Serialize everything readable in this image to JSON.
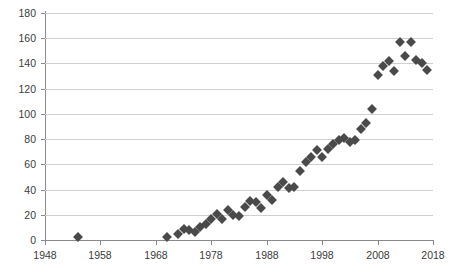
{
  "chart_data": {
    "type": "scatter",
    "title": "",
    "subtitle": "",
    "xlabel": "",
    "ylabel": "",
    "xlim": [
      1948,
      2018
    ],
    "ylim": [
      0,
      180
    ],
    "grid": true,
    "legend": false,
    "legend_position": "none",
    "marker": "diamond",
    "marker_color": "#4a4a4a",
    "grid_color": "#d0d0d0",
    "axis_color": "#8a8a8a",
    "xticks": [
      1948,
      1958,
      1968,
      1978,
      1988,
      1998,
      2008,
      2018
    ],
    "xtick_labels": [
      "1948",
      "1958",
      "1968",
      "1978",
      "1988",
      "1998",
      "2008",
      "2018"
    ],
    "yticks": [
      0,
      20,
      40,
      60,
      80,
      100,
      120,
      140,
      160,
      180
    ],
    "ytick_labels": [
      "0",
      "20",
      "40",
      "60",
      "80",
      "100",
      "120",
      "140",
      "160",
      "180"
    ],
    "series": [
      {
        "name": "observations",
        "points": [
          [
            1954,
            2
          ],
          [
            1970,
            2
          ],
          [
            1972,
            5
          ],
          [
            1973,
            9
          ],
          [
            1974,
            8
          ],
          [
            1975,
            6
          ],
          [
            1976,
            10
          ],
          [
            1977,
            13
          ],
          [
            1978,
            17
          ],
          [
            1979,
            21
          ],
          [
            1980,
            17
          ],
          [
            1981,
            24
          ],
          [
            1982,
            20
          ],
          [
            1983,
            19
          ],
          [
            1984,
            26
          ],
          [
            1985,
            31
          ],
          [
            1986,
            30
          ],
          [
            1987,
            25
          ],
          [
            1988,
            36
          ],
          [
            1989,
            32
          ],
          [
            1990,
            42
          ],
          [
            1991,
            46
          ],
          [
            1992,
            41
          ],
          [
            1993,
            42
          ],
          [
            1994,
            55
          ],
          [
            1995,
            62
          ],
          [
            1996,
            66
          ],
          [
            1997,
            71
          ],
          [
            1998,
            66
          ],
          [
            1999,
            72
          ],
          [
            2000,
            76
          ],
          [
            2001,
            79
          ],
          [
            2002,
            81
          ],
          [
            2003,
            78
          ],
          [
            2004,
            79
          ],
          [
            2005,
            88
          ],
          [
            2006,
            93
          ],
          [
            2007,
            104
          ],
          [
            2008,
            131
          ],
          [
            2009,
            138
          ],
          [
            2010,
            142
          ],
          [
            2011,
            134
          ],
          [
            2012,
            157
          ],
          [
            2013,
            146
          ],
          [
            2014,
            157
          ],
          [
            2015,
            143
          ],
          [
            2016,
            140
          ],
          [
            2017,
            135
          ]
        ]
      }
    ]
  }
}
